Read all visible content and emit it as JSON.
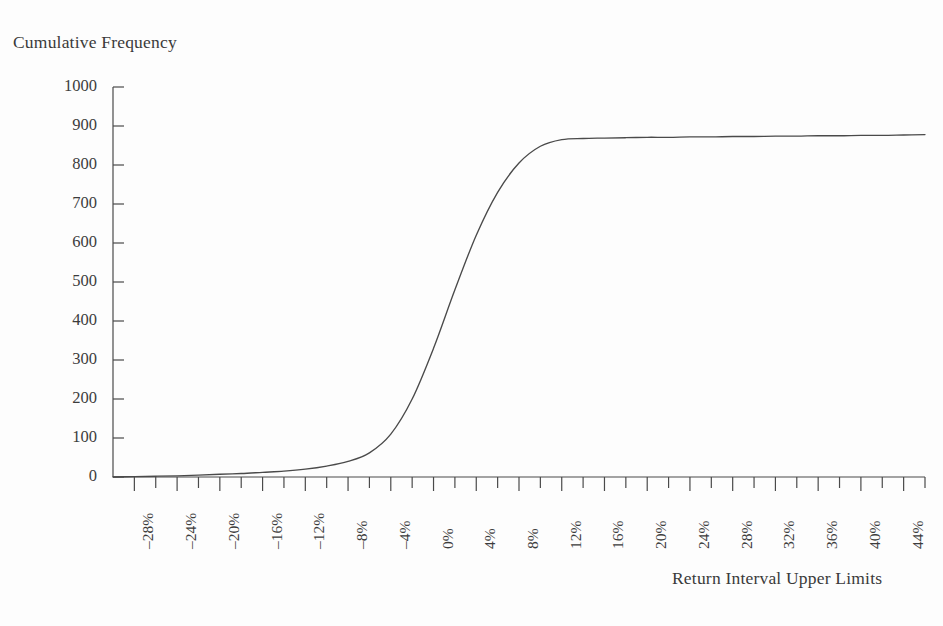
{
  "chart_data": {
    "type": "line",
    "title": "",
    "xlabel": "Return Interval Upper Limits",
    "ylabel": "Cumulative Frequency",
    "ylim": [
      0,
      1000
    ],
    "y_ticks": [
      0,
      100,
      200,
      300,
      400,
      500,
      600,
      700,
      800,
      900,
      1000
    ],
    "y_tick_labels": [
      "0",
      "100",
      "200",
      "300",
      "400",
      "500",
      "600",
      "700",
      "800",
      "900",
      "1000"
    ],
    "x_tick_labels": [
      "–28%",
      "–24%",
      "–20%",
      "–16%",
      "–12%",
      "–8%",
      "–4%",
      "0%",
      "4%",
      "8%",
      "12%",
      "16%",
      "20%",
      "24%",
      "28%",
      "32%",
      "36%",
      "40%",
      "44%"
    ],
    "x_tick_values": [
      -28,
      -24,
      -20,
      -16,
      -12,
      -8,
      -4,
      0,
      4,
      8,
      12,
      16,
      20,
      24,
      28,
      32,
      36,
      40,
      44
    ],
    "x_minor_tick_step": 2,
    "xlim": [
      -30,
      46
    ],
    "grid": false,
    "legend": false,
    "line_color": "#4a4a4a",
    "axis_color": "#4a4a4a",
    "background_color": "#fdfdfd",
    "series": [
      {
        "name": "Cumulative Frequency",
        "x": [
          -30,
          -28,
          -26,
          -24,
          -22,
          -20,
          -18,
          -16,
          -14,
          -12,
          -10,
          -8,
          -6,
          -4,
          -2,
          0,
          2,
          4,
          6,
          8,
          10,
          12,
          14,
          16,
          18,
          20,
          22,
          24,
          26,
          28,
          30,
          32,
          34,
          36,
          38,
          40,
          42,
          44,
          46
        ],
        "values": [
          0,
          1,
          2,
          3,
          5,
          7,
          9,
          12,
          15,
          20,
          28,
          40,
          62,
          110,
          200,
          330,
          480,
          620,
          730,
          805,
          848,
          865,
          868,
          869,
          870,
          871,
          871,
          872,
          872,
          873,
          873,
          874,
          874,
          875,
          875,
          876,
          876,
          877,
          878
        ]
      }
    ]
  }
}
